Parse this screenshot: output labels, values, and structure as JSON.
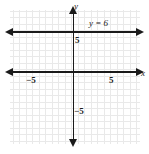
{
  "chart_data": {
    "type": "line",
    "title": "",
    "xlabel": "x",
    "ylabel": "y",
    "xlim": [
      -9.6,
      10.4
    ],
    "ylim": [
      -11.1,
      9.6
    ],
    "grid": true,
    "grid_spacing": 1,
    "legend": "none",
    "series": [
      {
        "name": "y = 6",
        "equation": "y = 6",
        "type": "horizontal-line",
        "y_value": 6,
        "x_range": [
          -9.6,
          10.4
        ],
        "arrows_both_ends": true,
        "color": "#1a1a1a"
      }
    ],
    "annotations": [
      {
        "text": "y = 6",
        "x": 3.2,
        "y": 7.3,
        "italic": true
      }
    ],
    "xticks": [
      -5,
      5
    ],
    "xtick_labels": [
      "−5",
      "5"
    ],
    "yticks": [
      -5,
      5
    ],
    "ytick_labels": [
      "−5",
      "5"
    ],
    "axis_color": "#1a1a1a",
    "grid_color": "#e9e9e9",
    "background": "#ffffff"
  },
  "axes": {
    "x_name": "x",
    "y_name": "y"
  },
  "ticks": {
    "y_positive": "5",
    "y_negative": "−5",
    "x_positive": "5",
    "x_negative": "−5"
  },
  "line_label": {
    "text": "y = 6"
  }
}
